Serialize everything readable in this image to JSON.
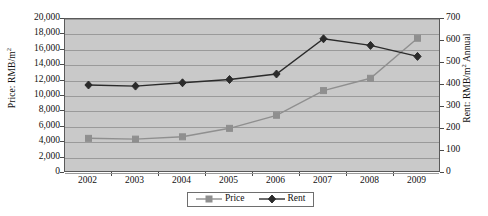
{
  "chart_data": {
    "type": "line",
    "title": "",
    "xlabel": "",
    "ylabel": "Price: RMB/m2",
    "y2label": "Rent: RMB/m2 Annual",
    "categories": [
      "2002",
      "2003",
      "2004",
      "2005",
      "2006",
      "2007",
      "2008",
      "2009"
    ],
    "grid": true,
    "legend_position": "bottom-center",
    "axes": {
      "left": {
        "title_main": "Price: RMB/m",
        "title_sup": "2",
        "min": 0,
        "max": 20000,
        "step": 2000,
        "ticks": [
          "0",
          "2,000",
          "4,000",
          "6,000",
          "8,000",
          "10,000",
          "12,000",
          "14,000",
          "16,000",
          "18,000",
          "20,000"
        ]
      },
      "right": {
        "title_main_a": "Rent: RMB/m",
        "title_sup": "2",
        "title_main_b": " Annual",
        "min": 0,
        "max": 700,
        "step": 100,
        "ticks": [
          "0",
          "100",
          "200",
          "300",
          "400",
          "500",
          "600",
          "700"
        ]
      }
    },
    "series": [
      {
        "name": "Price",
        "axis": "left",
        "color": "#8f8f8f",
        "marker": "square",
        "values": [
          4500,
          4400,
          4700,
          5800,
          7500,
          10700,
          12300,
          17500
        ]
      },
      {
        "name": "Rent",
        "axis": "right",
        "color": "#2b2b2b",
        "marker": "diamond",
        "values": [
          400,
          395,
          410,
          425,
          450,
          610,
          580,
          530
        ]
      }
    ]
  },
  "legend": {
    "items": [
      {
        "label": "Price"
      },
      {
        "label": "Rent"
      }
    ]
  },
  "colors": {
    "plot_background": "#c9c9c9",
    "gridline": "#9a9a9a",
    "frame": "#5a5a5a",
    "price_line": "#8f8f8f",
    "rent_line": "#2b2b2b"
  }
}
